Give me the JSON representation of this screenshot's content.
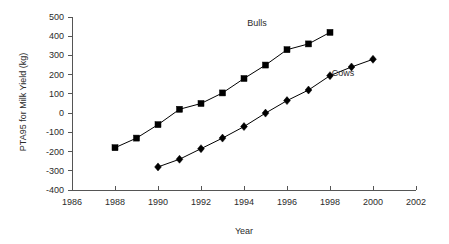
{
  "chart_data": {
    "type": "line",
    "title": "",
    "xlabel": "Year",
    "ylabel": "PTA95 for Milk Yield (kg)",
    "xlim": [
      1986,
      2002
    ],
    "ylim": [
      -400,
      500
    ],
    "xticks": [
      1986,
      1988,
      1990,
      1992,
      1994,
      1996,
      1998,
      2000,
      2002
    ],
    "yticks": [
      500,
      400,
      300,
      200,
      100,
      0,
      -100,
      -200,
      -300,
      -400
    ],
    "xtick_labels": [
      "1986",
      "1988",
      "1990",
      "1992",
      "1994",
      "1996",
      "1998",
      "2000",
      "2002"
    ],
    "ytick_labels": [
      "500",
      "400",
      "300",
      "200",
      "100",
      "0",
      "-100",
      "-200",
      "-300",
      "-400"
    ],
    "grid": false,
    "legend_position": "inline-annotation",
    "series": [
      {
        "name": "Bulls",
        "marker": "square",
        "color": "#000000",
        "label_x": 1994.6,
        "label_y": 455,
        "x": [
          1988,
          1989,
          1990,
          1991,
          1992,
          1993,
          1994,
          1995,
          1996,
          1997,
          1998
        ],
        "values": [
          -180,
          -130,
          -60,
          20,
          50,
          105,
          180,
          250,
          330,
          360,
          420
        ]
      },
      {
        "name": "Cows",
        "marker": "diamond",
        "color": "#000000",
        "label_x": 1998.6,
        "label_y": 195,
        "x": [
          1990,
          1991,
          1992,
          1993,
          1994,
          1995,
          1996,
          1997,
          1998,
          1999,
          2000
        ],
        "values": [
          -280,
          -240,
          -185,
          -130,
          -70,
          0,
          65,
          120,
          195,
          240,
          280
        ]
      }
    ]
  },
  "axis": {
    "x_title": "Year",
    "y_title": "PTA95 for Milk Yield (kg)"
  }
}
